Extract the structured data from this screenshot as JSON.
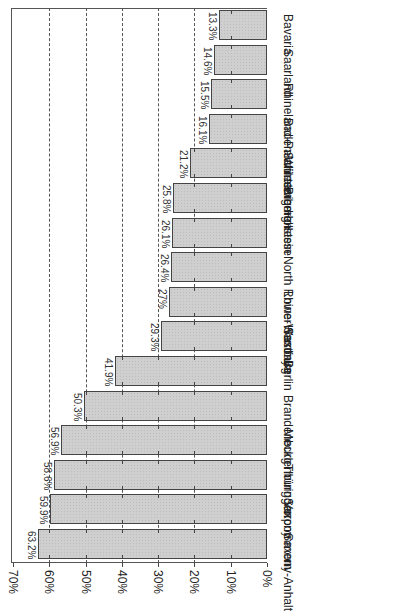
{
  "chart_data": {
    "type": "bar",
    "orientation": "horizontal (image rotated 90°)",
    "title": "",
    "xlabel": "",
    "ylabel": "",
    "ylim": [
      0,
      70
    ],
    "grid": "dashed vertical lines at 20%-60%",
    "legend": "none",
    "categories": [
      "Saxony-Anhalt",
      "Saxony",
      "Thüringen",
      "Mecklenburg Vorpommern",
      "Brandenburg",
      "Berlin",
      "Hamburg",
      "Lower Saxony",
      "North Rhine-Westfalia",
      "Hesse",
      "Bremen",
      "Schleswig-Holstein",
      "Baden-Würtemberg",
      "Rhineland-Palatinate",
      "Saarland",
      "Bavaria"
    ],
    "values": [
      63.2,
      59.9,
      58.6,
      56.9,
      50.3,
      41.9,
      29.3,
      27,
      26.4,
      26.1,
      25.8,
      21.2,
      16.1,
      15.5,
      14.6,
      13.3
    ],
    "value_labels": [
      "63.2%",
      "59.9%",
      "58.6%",
      "56.9%",
      "50.3%",
      "41.9%",
      "29.3%",
      "27%",
      "26.4%",
      "26.1%",
      "25.8%",
      "21.2%",
      "16.1%",
      "15.5%",
      "14.6%",
      "13.3%"
    ],
    "tick_labels": [
      "0%",
      "10%",
      "20%",
      "30%",
      "40%",
      "50%",
      "60%",
      "70%"
    ],
    "tick_values": [
      0,
      10,
      20,
      30,
      40,
      50,
      60,
      70
    ]
  }
}
